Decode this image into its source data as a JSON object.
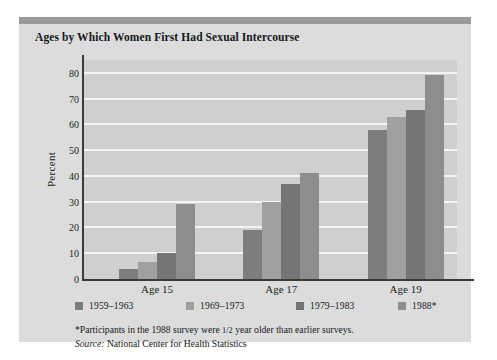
{
  "panel": {
    "title": "Ages by Which Women First Had Sexual Intercourse",
    "background_color": "#dcdcdc",
    "topbar_color": "#9a9a9a",
    "plot_background_color": "#cfcfcf",
    "gridline_color": "#f4f4f4",
    "axis_color": "#3a3a3a"
  },
  "footnotes": {
    "asterisk_note_before": "*Participants in the 1988 survey were ",
    "asterisk_fraction": "1/2",
    "asterisk_note_after": " year older than earlier surveys.",
    "source_label": "Source:",
    "source_text": " National Center for Health Statistics"
  },
  "chart_data": {
    "type": "bar",
    "title": "Ages by Which Women First Had Sexual Intercourse",
    "xlabel": "",
    "ylabel": "Percent",
    "ylim": [
      0,
      85
    ],
    "yticks": [
      0,
      10,
      20,
      30,
      40,
      50,
      60,
      70,
      80
    ],
    "ytick_labels": [
      "0",
      "10",
      "20",
      "30",
      "40",
      "50",
      "60",
      "70",
      "80"
    ],
    "grid": true,
    "grid_axis": "y",
    "legend_position": "below-axis",
    "categories": [
      "Age 15",
      "Age 17",
      "Age 19"
    ],
    "series": [
      {
        "name": "1959–1963",
        "color": "#7d7d7d",
        "values": [
          4,
          19,
          58
        ]
      },
      {
        "name": "1969–1973",
        "color": "#a0a0a0",
        "values": [
          6.5,
          30,
          63
        ]
      },
      {
        "name": "1979–1983",
        "color": "#757575",
        "values": [
          10,
          37,
          65.5
        ]
      },
      {
        "name": "1988*",
        "color": "#8d8d8d",
        "values": [
          29,
          41,
          79
        ]
      }
    ]
  }
}
